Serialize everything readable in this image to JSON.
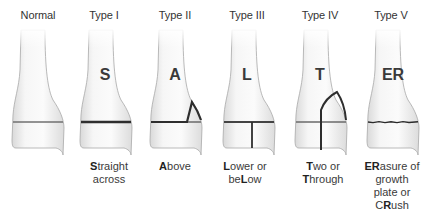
{
  "colors": {
    "bone_fill": "#efefef",
    "bone_outline": "#9a9a9a",
    "physis_line": "#6f6f6f",
    "fracture_line": "#2e2e2e",
    "text": "#333333"
  },
  "panels": [
    {
      "type": "Normal",
      "letter": "",
      "caption_lines": []
    },
    {
      "type": "Type I",
      "letter": "S",
      "caption_lines": [
        [
          {
            "t": "S",
            "b": true
          },
          {
            "t": "traight",
            "b": false
          }
        ],
        [
          {
            "t": "across",
            "b": false
          }
        ]
      ]
    },
    {
      "type": "Type II",
      "letter": "A",
      "caption_lines": [
        [
          {
            "t": "A",
            "b": true
          },
          {
            "t": "bove",
            "b": false
          }
        ]
      ]
    },
    {
      "type": "Type III",
      "letter": "L",
      "caption_lines": [
        [
          {
            "t": "L",
            "b": true
          },
          {
            "t": "ower or",
            "b": false
          }
        ],
        [
          {
            "t": "be",
            "b": false
          },
          {
            "t": "L",
            "b": true
          },
          {
            "t": "ow",
            "b": false
          }
        ]
      ]
    },
    {
      "type": "Type IV",
      "letter": "T",
      "caption_lines": [
        [
          {
            "t": "T",
            "b": true
          },
          {
            "t": "wo or",
            "b": false
          }
        ],
        [
          {
            "t": "T",
            "b": true
          },
          {
            "t": "hrough",
            "b": false
          }
        ]
      ]
    },
    {
      "type": "Type V",
      "letter": "ER",
      "caption_lines": [
        [
          {
            "t": "ER",
            "b": true
          },
          {
            "t": "asure of",
            "b": false
          }
        ],
        [
          {
            "t": "growth",
            "b": false
          }
        ],
        [
          {
            "t": "plate or",
            "b": false
          }
        ],
        [
          {
            "t": "C",
            "b": false
          },
          {
            "t": "R",
            "b": true
          },
          {
            "t": "ush",
            "b": false
          }
        ]
      ]
    }
  ],
  "labels": {
    "normal": "Normal",
    "type1": "Type I",
    "type2": "Type II",
    "type3": "Type III",
    "type4": "Type IV",
    "type5": "Type V"
  },
  "letters": {
    "type1": "S",
    "type2": "A",
    "type3": "L",
    "type4": "T",
    "type5": "ER"
  }
}
